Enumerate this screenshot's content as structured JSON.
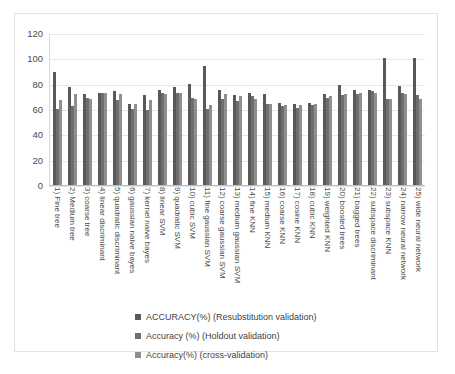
{
  "chart_data": {
    "type": "bar",
    "title": "",
    "xlabel": "",
    "ylabel": "",
    "ylim": [
      0,
      120
    ],
    "yticks": [
      0,
      20,
      40,
      60,
      80,
      100,
      120
    ],
    "grid": true,
    "legend_position": "bottom",
    "orientation": "vertical",
    "grouping": "clustered",
    "categories": [
      "1) Fine tree",
      "2) Medium tree",
      "3) coarse tree",
      "4) linear discriminant",
      "5) quadratic discriminant",
      "6) gaussian naive bayes",
      "7) kernel naive bayes",
      "8) linear SVM",
      "9) quadratic SVM",
      "10) cubic SVM",
      "11) fine gaussian SVM",
      "12) coarse gaussian SVM",
      "13) medium gaussian SVM",
      "14) fine KNN",
      "15) medium KNN",
      "16) coarse KNN",
      "17) cosine KNN",
      "18) cubic KNN",
      "19) weighted KNN",
      "20) boosted trees",
      "21) bagged trees",
      "22) subspace discriminant",
      "23) subspace KNN",
      "24) narrow neural network",
      "25) wide neural network"
    ],
    "series": [
      {
        "name": "ACCURACY(%) (Resubstitution validation)",
        "color": "#595959",
        "values": [
          89,
          77,
          72,
          73,
          74,
          64,
          71,
          75,
          77,
          80,
          94,
          75,
          71,
          73,
          72,
          65,
          64,
          65,
          72,
          79,
          75,
          75,
          100,
          78,
          100
        ]
      },
      {
        "name": "Accuracy (%) (Holdout validation)",
        "color": "#6e6e6e",
        "values": [
          60,
          62,
          69,
          73,
          67,
          60,
          59,
          73,
          73,
          69,
          60,
          68,
          66,
          70,
          64,
          62,
          61,
          63,
          69,
          71,
          72,
          74,
          68,
          73,
          71
        ]
      },
      {
        "name": "Accuracy(%) (cross-validation)",
        "color": "#8f8f8f",
        "values": [
          67,
          72,
          68,
          73,
          72,
          64,
          67,
          72,
          73,
          68,
          63,
          72,
          70,
          68,
          64,
          63,
          63,
          64,
          70,
          72,
          73,
          73,
          68,
          72,
          68
        ]
      }
    ]
  },
  "legend": {
    "items": [
      {
        "label": "ACCURACY(%) (Resubstitution validation)"
      },
      {
        "label": "Accuracy (%) (Holdout validation)"
      },
      {
        "label": "Accuracy(%) (cross-validation)"
      }
    ]
  }
}
